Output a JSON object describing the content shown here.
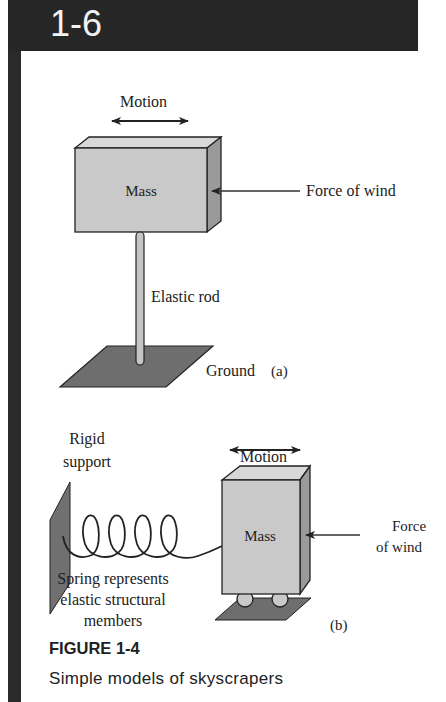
{
  "header": {
    "section_number": "1-6"
  },
  "figure": {
    "panel_a": {
      "motion_label": "Motion",
      "mass_label": "Mass",
      "force_label": "Force of wind",
      "rod_label": "Elastic rod",
      "ground_label": "Ground",
      "panel_tag": "(a)"
    },
    "panel_b": {
      "support_label_line1": "Rigid",
      "support_label_line2": "support",
      "motion_label": "Motion",
      "mass_label": "Mass",
      "force_label_line1": "Force",
      "force_label_line2": "of wind",
      "spring_label_line1": "Spring represents",
      "spring_label_line2": "elastic structural",
      "spring_label_line3": "members",
      "panel_tag": "(b)"
    },
    "colors": {
      "header_bg": "#262626",
      "mass_face": "#c9c9c9",
      "mass_side": "#9a9a9a",
      "ground": "#6e6e6e"
    }
  },
  "caption": {
    "title": "FIGURE 1-4",
    "text": "Simple models of skyscrapers"
  }
}
